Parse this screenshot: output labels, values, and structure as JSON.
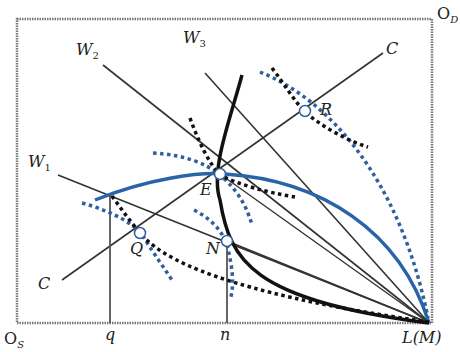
{
  "colors": {
    "frame": "#777777",
    "line": "#333333",
    "thick_curve": "#111111",
    "blue_curve": "#2a64a8",
    "blue_dotted": "#2f5f9e",
    "black_dotted": "#111111"
  },
  "frame": {
    "x1": 17,
    "y1": 19,
    "x2": 432,
    "y2": 323
  },
  "labels": {
    "od": {
      "main": "O",
      "sub": "D"
    },
    "os": {
      "main": "O",
      "sub": "S"
    },
    "q": "q",
    "n": "n",
    "lm": "L(M)",
    "w1": {
      "main": "W",
      "sub": "1"
    },
    "w2": {
      "main": "W",
      "sub": "2"
    },
    "w3": {
      "main": "W",
      "sub": "3"
    },
    "c_top": "C",
    "c_bottom": "C",
    "e": "E",
    "n_point": "N",
    "q_point": "Q",
    "r": "R"
  },
  "points": {
    "E": [
      220,
      174
    ],
    "N": [
      227,
      241
    ],
    "Q": [
      140,
      233
    ],
    "R": [
      305,
      111
    ],
    "L": [
      429,
      323
    ]
  },
  "lines": {
    "W1": [
      [
        58,
        175
      ],
      [
        429,
        323
      ]
    ],
    "W2": [
      [
        103,
        65
      ],
      [
        429,
        323
      ]
    ],
    "W3": [
      [
        205,
        73
      ],
      [
        429,
        323
      ]
    ],
    "C": [
      [
        62,
        280
      ],
      [
        383,
        53
      ]
    ],
    "vertical_q": [
      [
        110,
        193
      ],
      [
        110,
        323
      ]
    ],
    "vertical_n": [
      [
        227,
        241
      ],
      [
        227,
        323
      ]
    ]
  }
}
